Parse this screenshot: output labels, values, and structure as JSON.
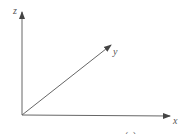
{
  "diagram": {
    "type": "3d-coordinate-axes",
    "axes": [
      {
        "name": "x",
        "label": "x"
      },
      {
        "name": "y",
        "label": "y"
      },
      {
        "name": "z",
        "label": "z"
      }
    ],
    "caption": "(a)",
    "colors": {
      "axis": "#555555",
      "background": "#ffffff"
    }
  }
}
